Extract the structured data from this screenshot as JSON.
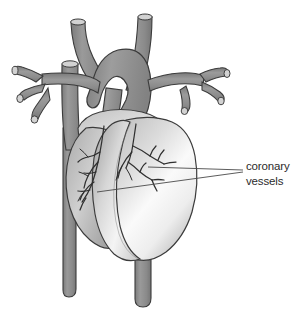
{
  "figure": {
    "background_color": "#ffffff",
    "annotations": [
      {
        "id": "coronary-vessels",
        "line_1": "coronary",
        "line_2": "vessels",
        "text_color": "#2b2b2b",
        "leader_count": 2
      }
    ]
  },
  "palette": {
    "vessel_fill": "#8f8f8f",
    "vessel_fill_dark": "#7d7d7d",
    "vessel_cut_end": "#d2d2d2",
    "outline": "#3b3b3b",
    "myocardium_light": "#fbfbfb",
    "myocardium_mid": "#c9c9c9",
    "myocardium_shadow": "#9a9a9a",
    "coronary_artery": "#2f2f2f",
    "leader_line": "#4a4a4a"
  },
  "anatomy": {
    "structures": [
      {
        "name": "aortic-arch",
        "group": "great-vessels"
      },
      {
        "name": "brachiocephalic-trunk",
        "group": "great-vessels"
      },
      {
        "name": "left-subclavian-artery",
        "group": "great-vessels"
      },
      {
        "name": "superior-vena-cava",
        "group": "great-vessels"
      },
      {
        "name": "pulmonary-trunk",
        "group": "great-vessels"
      },
      {
        "name": "right-pulmonary-artery",
        "group": "great-vessels"
      },
      {
        "name": "left-pulmonary-artery",
        "group": "great-vessels"
      },
      {
        "name": "right-pulmonary-veins",
        "group": "great-vessels"
      },
      {
        "name": "left-pulmonary-veins",
        "group": "great-vessels"
      },
      {
        "name": "descending-aorta",
        "group": "great-vessels"
      },
      {
        "name": "inferior-vena-cava",
        "group": "great-vessels"
      },
      {
        "name": "right-atrium",
        "group": "chambers"
      },
      {
        "name": "right-ventricle",
        "group": "chambers"
      },
      {
        "name": "left-ventricle",
        "group": "chambers"
      },
      {
        "name": "left-coronary-artery-branches",
        "group": "coronary-vessels"
      },
      {
        "name": "right-coronary-artery-branches",
        "group": "coronary-vessels"
      }
    ]
  }
}
